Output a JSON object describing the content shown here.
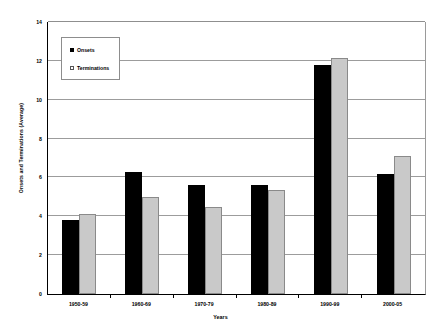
{
  "chart_data": {
    "type": "bar",
    "title": "",
    "xlabel": "Years",
    "ylabel": "Onsets and Terminations (Average)",
    "categories": [
      "1950-59",
      "1960-69",
      "1970-79",
      "1980-89",
      "1990-99",
      "2000-05"
    ],
    "series": [
      {
        "name": "Onsets",
        "color": "#000000",
        "values": [
          3.8,
          6.3,
          5.6,
          5.6,
          11.8,
          6.2
        ]
      },
      {
        "name": "Terminations",
        "color": "#c9c9c9",
        "values": [
          4.1,
          5.0,
          4.5,
          5.35,
          12.15,
          7.1
        ]
      }
    ],
    "ylim": [
      0,
      14
    ],
    "yticks": [
      0,
      2,
      4,
      6,
      8,
      10,
      12,
      14
    ],
    "ytick_labels": [
      "0",
      "2",
      "4",
      "6",
      "8",
      "10",
      "12",
      "14"
    ],
    "grid": true,
    "grid_axis": "y",
    "legend_position": "upper left",
    "plot_background": "#ffffff",
    "gridline_color": "#9c9c9c",
    "axis_color": "#000000"
  },
  "legend": {
    "entries": [
      {
        "label": "Onsets",
        "swatch": "filled-square-icon"
      },
      {
        "label": "Terminations",
        "swatch": "open-square-icon"
      }
    ]
  }
}
